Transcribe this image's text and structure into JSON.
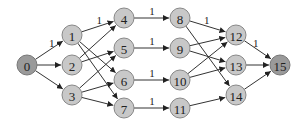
{
  "diagram": {
    "type": "directed-graph",
    "nodes": [
      {
        "id": "0",
        "x": 27,
        "y": 65,
        "terminal": true
      },
      {
        "id": "1",
        "x": 72,
        "y": 35
      },
      {
        "id": "2",
        "x": 72,
        "y": 65
      },
      {
        "id": "3",
        "x": 72,
        "y": 95
      },
      {
        "id": "4",
        "x": 124,
        "y": 18
      },
      {
        "id": "5",
        "x": 124,
        "y": 48
      },
      {
        "id": "6",
        "x": 124,
        "y": 80
      },
      {
        "id": "7",
        "x": 124,
        "y": 108
      },
      {
        "id": "8",
        "x": 180,
        "y": 18
      },
      {
        "id": "9",
        "x": 180,
        "y": 48
      },
      {
        "id": "10",
        "x": 180,
        "y": 80
      },
      {
        "id": "11",
        "x": 180,
        "y": 108
      },
      {
        "id": "12",
        "x": 236,
        "y": 35
      },
      {
        "id": "13",
        "x": 236,
        "y": 65
      },
      {
        "id": "14",
        "x": 236,
        "y": 95
      },
      {
        "id": "15",
        "x": 280,
        "y": 65,
        "terminal": true
      }
    ],
    "edges": [
      {
        "from": "0",
        "to": "1",
        "label": "1"
      },
      {
        "from": "0",
        "to": "2",
        "label": ""
      },
      {
        "from": "0",
        "to": "3",
        "label": ""
      },
      {
        "from": "1",
        "to": "4",
        "label": "1"
      },
      {
        "from": "1",
        "to": "6",
        "label": ""
      },
      {
        "from": "1",
        "to": "7",
        "label": ""
      },
      {
        "from": "2",
        "to": "4",
        "label": ""
      },
      {
        "from": "2",
        "to": "5",
        "label": ""
      },
      {
        "from": "3",
        "to": "5",
        "label": ""
      },
      {
        "from": "3",
        "to": "6",
        "label": ""
      },
      {
        "from": "3",
        "to": "7",
        "label": ""
      },
      {
        "from": "4",
        "to": "8",
        "label": "1"
      },
      {
        "from": "5",
        "to": "9",
        "label": "1"
      },
      {
        "from": "6",
        "to": "10",
        "label": "1"
      },
      {
        "from": "7",
        "to": "11",
        "label": "1"
      },
      {
        "from": "8",
        "to": "12",
        "label": "1"
      },
      {
        "from": "8",
        "to": "14",
        "label": ""
      },
      {
        "from": "9",
        "to": "12",
        "label": ""
      },
      {
        "from": "9",
        "to": "13",
        "label": ""
      },
      {
        "from": "10",
        "to": "12",
        "label": ""
      },
      {
        "from": "10",
        "to": "13",
        "label": ""
      },
      {
        "from": "11",
        "to": "14",
        "label": ""
      },
      {
        "from": "12",
        "to": "15",
        "label": "1"
      },
      {
        "from": "13",
        "to": "15",
        "label": ""
      },
      {
        "from": "14",
        "to": "15",
        "label": ""
      }
    ],
    "node_radius": 10,
    "colors": {
      "node_fill": "#c8c8c8",
      "terminal_fill": "#9a9a9a",
      "edge": "#333333"
    }
  }
}
